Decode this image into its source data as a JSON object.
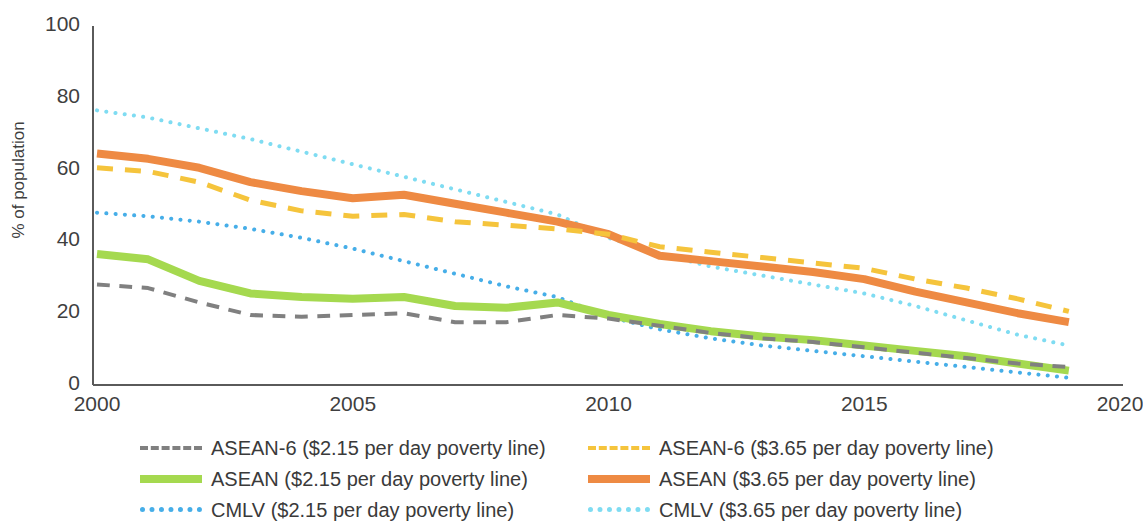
{
  "axes": {
    "y_title": "% of population",
    "y_ticks": [
      "0",
      "20",
      "40",
      "60",
      "80",
      "100"
    ],
    "x_ticks": [
      "2000",
      "2005",
      "2010",
      "2015",
      "2020"
    ]
  },
  "legend": {
    "items": [
      {
        "label": "ASEAN-6 ($2.15 per day poverty line)",
        "color": "#808080",
        "style": "dashed",
        "column": "left",
        "row": 1
      },
      {
        "label": "ASEAN-6 ($3.65 per day poverty line)",
        "color": "#F5C43C",
        "style": "dashed",
        "column": "right",
        "row": 1
      },
      {
        "label": "ASEAN ($2.15 per day poverty line)",
        "color": "#A5D94F",
        "style": "solid",
        "column": "left",
        "row": 2
      },
      {
        "label": "ASEAN ($3.65 per day poverty line)",
        "color": "#EE8A43",
        "style": "solid",
        "column": "right",
        "row": 2
      },
      {
        "label": "CMLV ($2.15 per day poverty line)",
        "color": "#46AEE8",
        "style": "dotted",
        "column": "left",
        "row": 3
      },
      {
        "label": "CMLV ($3.65 per day poverty line)",
        "color": "#7FDCF2",
        "style": "dotted",
        "column": "right",
        "row": 3
      }
    ]
  },
  "chart_data": {
    "type": "line",
    "title": "",
    "xlabel": "",
    "ylabel": "% of population",
    "xlim": [
      2000,
      2020
    ],
    "ylim": [
      0,
      100
    ],
    "ytick_values": [
      0,
      20,
      40,
      60,
      80,
      100
    ],
    "xtick_values": [
      2000,
      2005,
      2010,
      2015,
      2020
    ],
    "grid": false,
    "legend_position": "below",
    "x": [
      2000,
      2001,
      2002,
      2003,
      2004,
      2005,
      2006,
      2007,
      2008,
      2009,
      2010,
      2011,
      2012,
      2013,
      2014,
      2015,
      2016,
      2017,
      2018,
      2019
    ],
    "series": [
      {
        "name": "CMLV ($3.65 per day poverty line)",
        "color": "#7FDCF2",
        "style": "dotted",
        "width": 4,
        "values": [
          76.5,
          74.5,
          71.5,
          68.5,
          65.0,
          61.5,
          58.0,
          54.5,
          51.0,
          47.5,
          41.0,
          36.5,
          33.0,
          30.5,
          28.0,
          25.5,
          22.0,
          18.0,
          14.0,
          11.0
        ]
      },
      {
        "name": "ASEAN ($3.65 per day poverty line)",
        "color": "#EE8A43",
        "style": "solid",
        "width": 8,
        "values": [
          64.5,
          63.0,
          60.5,
          56.5,
          54.0,
          52.0,
          53.0,
          50.5,
          48.0,
          45.5,
          42.0,
          36.0,
          34.5,
          33.0,
          31.5,
          29.5,
          26.0,
          23.0,
          20.0,
          17.5
        ]
      },
      {
        "name": "ASEAN-6 ($3.65 per day poverty line)",
        "color": "#F5C43C",
        "style": "dashed",
        "width": 5,
        "values": [
          60.5,
          59.5,
          56.5,
          51.5,
          48.5,
          47.0,
          47.5,
          45.5,
          44.5,
          43.5,
          42.0,
          38.5,
          37.0,
          35.5,
          34.0,
          32.5,
          29.5,
          27.0,
          24.0,
          20.5
        ]
      },
      {
        "name": "CMLV ($2.15 per day poverty line)",
        "color": "#46AEE8",
        "style": "dotted",
        "width": 4,
        "values": [
          48.0,
          47.0,
          45.5,
          43.5,
          41.0,
          38.0,
          34.5,
          31.0,
          27.5,
          24.5,
          19.0,
          15.5,
          13.0,
          11.0,
          9.5,
          8.0,
          6.5,
          5.0,
          3.5,
          2.0
        ]
      },
      {
        "name": "ASEAN ($2.15 per day poverty line)",
        "color": "#A5D94F",
        "style": "solid",
        "width": 8,
        "values": [
          36.5,
          35.0,
          29.0,
          25.5,
          24.5,
          24.0,
          24.5,
          22.0,
          21.5,
          23.0,
          19.5,
          17.0,
          15.0,
          13.5,
          12.5,
          11.0,
          9.5,
          8.0,
          6.0,
          4.0
        ]
      },
      {
        "name": "ASEAN-6 ($2.15 per day poverty line)",
        "color": "#808080",
        "style": "dashed",
        "width": 4,
        "values": [
          28.0,
          27.0,
          23.0,
          19.5,
          19.0,
          19.5,
          20.0,
          17.5,
          17.5,
          19.5,
          18.5,
          16.5,
          14.5,
          13.0,
          12.0,
          10.5,
          9.0,
          7.5,
          6.0,
          5.0
        ]
      }
    ]
  }
}
